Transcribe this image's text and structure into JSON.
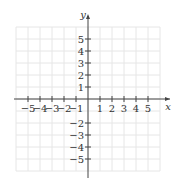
{
  "chart_data": {
    "type": "scatter",
    "title": "",
    "xlabel": "x",
    "ylabel": "y",
    "xlim": [
      -6,
      6
    ],
    "ylim": [
      -6,
      6
    ],
    "grid": true,
    "x_ticks": [
      -5,
      -4,
      -3,
      -2,
      -1,
      1,
      2,
      3,
      4,
      5
    ],
    "y_ticks": [
      5,
      4,
      3,
      2,
      1,
      -2,
      -3,
      -4,
      -5
    ],
    "x_tick_labels": [
      "−5",
      "−4",
      "−3",
      "−2",
      "−1",
      "1",
      "2",
      "3",
      "4",
      "5"
    ],
    "y_tick_labels": [
      "5",
      "4",
      "3",
      "2",
      "1",
      "−2",
      "−3",
      "−4",
      "−5"
    ],
    "series": []
  },
  "colors": {
    "grid": "#e6e6e6",
    "axis": "#444444",
    "text": "#333333"
  }
}
